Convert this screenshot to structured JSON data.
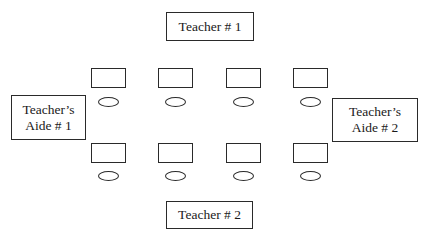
{
  "diagram": {
    "type": "classroom-seating-layout",
    "teacher_1": {
      "label": "Teacher # 1"
    },
    "teacher_2": {
      "label": "Teacher # 2"
    },
    "aide_1": {
      "line1": "Teacher’s",
      "line2": "Aide # 1"
    },
    "aide_2": {
      "line1": "Teacher’s",
      "line2": "Aide # 2"
    },
    "rows": [
      {
        "name": "top-row",
        "desk_count": 4
      },
      {
        "name": "bottom-row",
        "desk_count": 4
      }
    ],
    "colors": {
      "stroke": "#2a2a2a",
      "background": "#ffffff",
      "text": "#1a1a1a"
    }
  }
}
